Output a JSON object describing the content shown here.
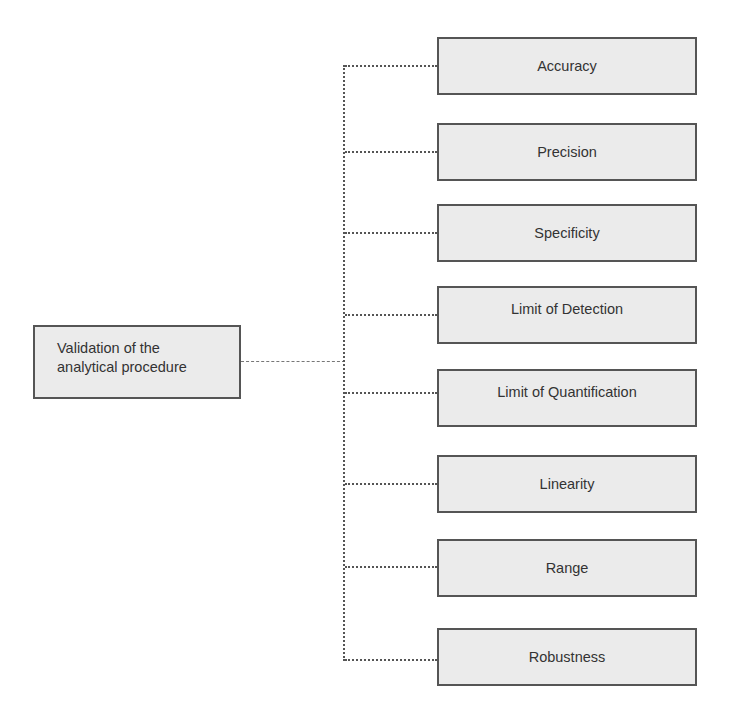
{
  "diagram": {
    "root": {
      "line1": "Validation of the",
      "line2": "analytical procedure"
    },
    "children": [
      {
        "label": "Accuracy"
      },
      {
        "label": "Precision"
      },
      {
        "label": "Specificity"
      },
      {
        "label": "Limit of Detection"
      },
      {
        "label": "Limit of Quantification"
      },
      {
        "label": "Linearity"
      },
      {
        "label": "Range"
      },
      {
        "label": "Robustness"
      }
    ],
    "colors": {
      "box_fill": "#ebebeb",
      "box_border": "#555555",
      "text": "#333333",
      "connector": "#555555"
    }
  }
}
